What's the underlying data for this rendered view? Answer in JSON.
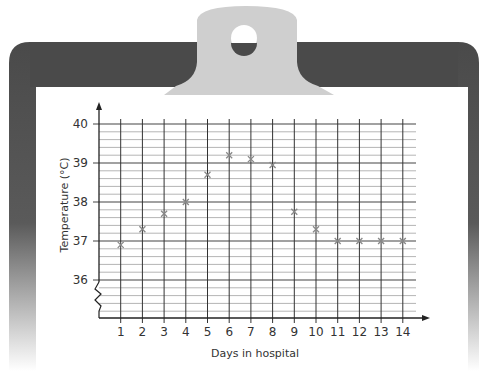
{
  "clipboard": {
    "board_color": "#4a4a4a",
    "clip_color": "#cfcfcf",
    "paper_color": "#ffffff"
  },
  "chart_data": {
    "type": "scatter",
    "title": "",
    "xlabel": "Days in hospital",
    "ylabel": "Temperature (°C)",
    "x": [
      1,
      2,
      3,
      4,
      5,
      6,
      7,
      8,
      9,
      10,
      11,
      12,
      13,
      14
    ],
    "series": [
      {
        "name": "Temperature",
        "marker": "x",
        "color": "#888888",
        "values": [
          36.9,
          37.3,
          37.7,
          38.0,
          38.7,
          39.2,
          39.1,
          38.95,
          37.75,
          37.3,
          37.0,
          37.0,
          37.0,
          37.0
        ]
      }
    ],
    "x_ticks": [
      "1",
      "2",
      "3",
      "4",
      "5",
      "6",
      "7",
      "8",
      "9",
      "10",
      "11",
      "12",
      "13",
      "14"
    ],
    "y_ticks": [
      "36",
      "37",
      "38",
      "39",
      "40"
    ],
    "ylim": [
      35,
      40
    ],
    "xlim": [
      0,
      14.6
    ],
    "y_minor_step": 0.2,
    "y_axis_break": true,
    "grid": true,
    "legend": "none"
  }
}
